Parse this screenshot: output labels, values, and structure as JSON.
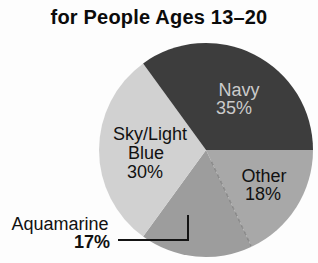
{
  "title": "for People Ages 13–20",
  "chart_data": {
    "type": "pie",
    "title": "for People Ages 13–20",
    "unit": "%",
    "direction": "clockwise",
    "start_angle_deg": 0,
    "legend": "none",
    "geometry": {
      "cx": 206,
      "cy": 150,
      "r": 107
    },
    "segments": [
      {
        "id": "other",
        "label": "Other",
        "value": 18,
        "color": "#a8a8a8",
        "label_color": "#111111",
        "end_edge_faint": true,
        "label_lines": [
          {
            "text": "Other",
            "x": 264,
            "y": 182
          },
          {
            "text": "18%",
            "x": 263,
            "y": 200
          }
        ]
      },
      {
        "id": "aquamarine",
        "label": "Aquamarine",
        "value": 17,
        "color": "#9d9d9d",
        "label_color": "#111111",
        "label_lines": [
          {
            "text": "Aquamarine",
            "x": 60,
            "y": 230
          },
          {
            "text": "17%",
            "x": 92,
            "y": 248,
            "bold": true
          }
        ]
      },
      {
        "id": "sky-light-blue",
        "label": "Sky/Light Blue",
        "value": 30,
        "color": "#d1d1d1",
        "label_color": "#111111",
        "label_lines": [
          {
            "text": "Sky/Light",
            "x": 150,
            "y": 140
          },
          {
            "text": "Blue",
            "x": 146,
            "y": 159
          },
          {
            "text": "30%",
            "x": 145,
            "y": 178
          }
        ]
      },
      {
        "id": "navy",
        "label": "Navy",
        "value": 35,
        "color": "#3d3d3d",
        "label_color": "#cbcbcb",
        "label_lines": [
          {
            "text": "Navy",
            "x": 239,
            "y": 96
          },
          {
            "text": "35%",
            "x": 234,
            "y": 114
          }
        ]
      }
    ],
    "leader_line": {
      "for": "aquamarine",
      "color": "#141414",
      "width": 2,
      "points": [
        [
          118,
          240
        ],
        [
          188,
          240
        ],
        [
          188,
          215
        ]
      ]
    }
  }
}
